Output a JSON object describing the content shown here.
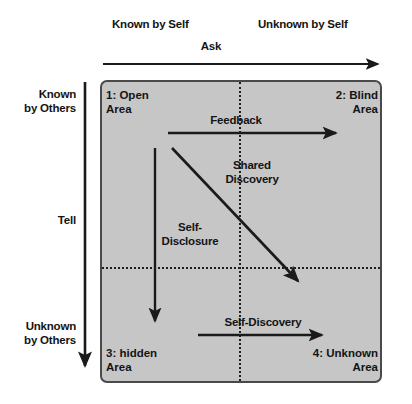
{
  "diagram": {
    "box": {
      "fill": "#c6c6c6",
      "border": "#4a4a4a"
    },
    "axis_headers": {
      "top_left": "Known by Self",
      "top_right": "Unknown by Self",
      "left_top": "Known\nby Others",
      "left_middle": "Tell",
      "left_bottom": "Unknown\nby Others",
      "top_axis_arrow_label": "Ask"
    },
    "quadrants": [
      {
        "id": "q1",
        "label": "1: Open\nArea"
      },
      {
        "id": "q2",
        "label": "2: Blind\nArea"
      },
      {
        "id": "q3",
        "label": "3: hidden\nArea"
      },
      {
        "id": "q4",
        "label": "4: Unknown\nArea"
      }
    ],
    "arrow_labels": {
      "feedback": "Feedback",
      "shared_discovery": "Shared\nDiscovery",
      "self_disclosure": "Self-\nDisclosure",
      "self_discovery": "Self-Discovery"
    },
    "arrows": [
      {
        "name": "ask-arrow",
        "direction": "right",
        "from": [
          103,
          64
        ],
        "to": [
          382,
          64
        ]
      },
      {
        "name": "tell-arrow",
        "direction": "down",
        "from": [
          85,
          82
        ],
        "to": [
          85,
          372
        ]
      },
      {
        "name": "feedback-arrow",
        "direction": "right",
        "from": [
          168,
          133
        ],
        "to": [
          340,
          133
        ]
      },
      {
        "name": "shared-discovery-arrow",
        "direction": "down-right",
        "from": [
          172,
          148
        ],
        "to": [
          303,
          286
        ]
      },
      {
        "name": "self-disclosure-arrow",
        "direction": "down",
        "from": [
          155,
          148
        ],
        "to": [
          155,
          327
        ]
      },
      {
        "name": "self-discovery-arrow",
        "direction": "right",
        "from": [
          198,
          335
        ],
        "to": [
          327,
          335
        ]
      }
    ],
    "colors": {
      "text": "#141414",
      "arrow": "#1a1a1a",
      "panel_fill": "#c6c6c6",
      "panel_border": "#4a4a4a",
      "divider": "#1f1f1f"
    }
  }
}
